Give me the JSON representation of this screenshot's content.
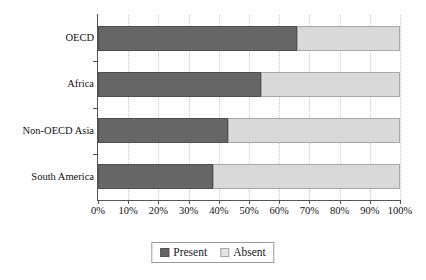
{
  "chart_data": {
    "type": "bar",
    "orientation": "horizontal",
    "stacked": true,
    "normalized": true,
    "title": "",
    "xlabel": "",
    "ylabel": "",
    "xlim": [
      0,
      100
    ],
    "grid": true,
    "legend_position": "bottom",
    "categories": [
      "OECD",
      "Africa",
      "Non-OECD Asia",
      "South America"
    ],
    "series": [
      {
        "name": "Present",
        "color": "#666666",
        "values": [
          66,
          54,
          43,
          38
        ]
      },
      {
        "name": "Absent",
        "color": "#d9d9d9",
        "values": [
          34,
          46,
          57,
          62
        ]
      }
    ],
    "x_tick_labels": [
      "0%",
      "10%",
      "20%",
      "30%",
      "40%",
      "50%",
      "60%",
      "70%",
      "80%",
      "90%",
      "100%"
    ],
    "x_tick_values": [
      0,
      10,
      20,
      30,
      40,
      50,
      60,
      70,
      80,
      90,
      100
    ]
  },
  "legend": {
    "items": [
      {
        "label": "Present",
        "swatch": "dark-gray-swatch"
      },
      {
        "label": "Absent",
        "swatch": "light-gray-swatch"
      }
    ]
  },
  "colors": {
    "present": "#666666",
    "absent": "#d9d9d9",
    "axis": "#555555",
    "gridline": "#c8c8c8",
    "text": "#111111",
    "background": "#ffffff"
  }
}
